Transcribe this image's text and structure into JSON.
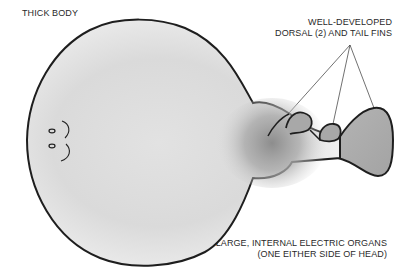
{
  "figure": {
    "colors": {
      "outline": "#1e1e1e",
      "body_fill_light": "#f0f0f0",
      "body_fill_mid": "#cfcfcf",
      "organ_shadow": "#8a8a8a",
      "fin_fill": "#a9a9a9",
      "background": "#ffffff",
      "text": "#2a2a2a"
    }
  },
  "labels": {
    "thick_body": "THICK BODY",
    "fins_line1": "WELL-DEVELOPED",
    "fins_line2": "DORSAL (2) AND TAIL FINS",
    "organs_line1": "LARGE, INTERNAL ELECTRIC ORGANS",
    "organs_line2": "(ONE EITHER SIDE OF HEAD)"
  }
}
